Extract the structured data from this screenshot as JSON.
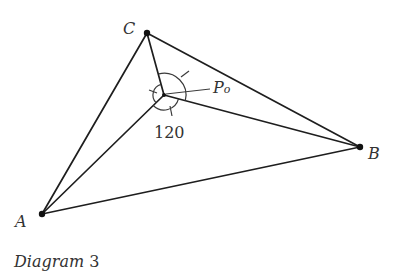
{
  "caption": {
    "italic_part": "Diagram",
    "number": "3"
  },
  "points": {
    "A": {
      "label": "A",
      "x": 42,
      "y": 214
    },
    "B": {
      "label": "B",
      "x": 360,
      "y": 147
    },
    "C": {
      "label": "C",
      "x": 147,
      "y": 33
    },
    "P": {
      "label": "P",
      "subscript": "o",
      "x": 164,
      "y": 95
    }
  },
  "angle_label": "120",
  "colors": {
    "line": "#1e1e1e",
    "text": "#333333",
    "background": "#ffffff"
  }
}
